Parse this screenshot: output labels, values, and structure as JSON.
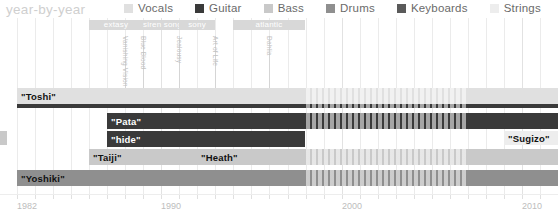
{
  "header": {
    "title": "year-by-year"
  },
  "legend": {
    "items": [
      {
        "label": "Vocals",
        "color": "#e0e0e0"
      },
      {
        "label": "Guitar",
        "color": "#3a3a3a"
      },
      {
        "label": "Bass",
        "color": "#c9c9c9"
      },
      {
        "label": "Drums",
        "color": "#8f8f8f"
      },
      {
        "label": "Keyboards",
        "color": "#5a5a5a"
      },
      {
        "label": "Strings",
        "color": "#ededed"
      }
    ]
  },
  "chart_data": {
    "type": "bar",
    "title": "year-by-year",
    "xlabel": "",
    "ylabel": "",
    "xlim": [
      1982,
      2012
    ],
    "grid": true,
    "legend_position": "top",
    "tick_labels": [
      "1982",
      "1990",
      "2000",
      "2010"
    ],
    "tick_years": [
      1982,
      1990,
      2000,
      2010
    ],
    "record_labels": [
      {
        "name": "extasy",
        "start": 1986,
        "end": 1989
      },
      {
        "name": "siren song",
        "start": 1989,
        "end": 1991
      },
      {
        "name": "sony",
        "start": 1991,
        "end": 1993
      },
      {
        "name": "atlantic",
        "start": 1994,
        "end": 1998
      }
    ],
    "albums": [
      {
        "name": "Vanishing Vision",
        "year": 1988
      },
      {
        "name": "Blue Blood",
        "year": 1989
      },
      {
        "name": "Jealousy",
        "year": 1991
      },
      {
        "name": "Art of Life",
        "year": 1993
      },
      {
        "name": "Dahlia",
        "year": 1996
      }
    ],
    "members": [
      {
        "name": "\"Toshi\"",
        "role": "Vocals",
        "start": 1982,
        "end": 2012
      },
      {
        "name": "\"Pata\"",
        "role": "Guitar",
        "start": 1987,
        "end": 2012
      },
      {
        "name": "\"hide\"",
        "role": "Guitar",
        "start": 1987,
        "end": 1998
      },
      {
        "name": "\"Taiji\"",
        "role": "Bass",
        "start": 1986,
        "end": 1992
      },
      {
        "name": "\"Heath\"",
        "role": "Bass",
        "start": 1992,
        "end": 2012
      },
      {
        "name": "\"Yoshiki\"",
        "role": "Drums",
        "start": 1982,
        "end": 2012
      },
      {
        "name": "\"Sugizo\"",
        "role": "Strings",
        "start": 2009,
        "end": 2012
      }
    ],
    "hiatus": {
      "start": 1998,
      "end": 2007
    }
  },
  "axis": {
    "ticks": [
      {
        "label": "1982",
        "x": 28
      },
      {
        "label": "1990",
        "x": 181
      },
      {
        "label": "2000",
        "x": 362
      },
      {
        "label": "2010",
        "x": 525
      }
    ]
  }
}
